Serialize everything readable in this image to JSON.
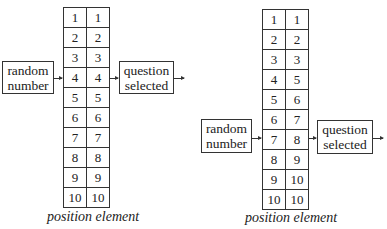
{
  "diagrams": [
    {
      "input_box": {
        "line1": "random",
        "line2": "number"
      },
      "output_box": {
        "line1": "question",
        "line2": "selected"
      },
      "caption": "position element",
      "input_row": 4,
      "table": {
        "columns": [
          "position",
          "element"
        ],
        "rows": [
          [
            "1",
            "1"
          ],
          [
            "2",
            "2"
          ],
          [
            "3",
            "3"
          ],
          [
            "4",
            "4"
          ],
          [
            "5",
            "5"
          ],
          [
            "6",
            "6"
          ],
          [
            "7",
            "7"
          ],
          [
            "8",
            "8"
          ],
          [
            "9",
            "9"
          ],
          [
            "10",
            "10"
          ]
        ]
      }
    },
    {
      "input_box": {
        "line1": "random",
        "line2": "number"
      },
      "output_box": {
        "line1": "question",
        "line2": "selected"
      },
      "caption": "position element",
      "input_row": 7,
      "table": {
        "columns": [
          "position",
          "element"
        ],
        "rows": [
          [
            "1",
            "1"
          ],
          [
            "2",
            "2"
          ],
          [
            "3",
            "3"
          ],
          [
            "4",
            "5"
          ],
          [
            "5",
            "6"
          ],
          [
            "6",
            "7"
          ],
          [
            "7",
            "8"
          ],
          [
            "8",
            "9"
          ],
          [
            "9",
            "10"
          ],
          [
            "10",
            "10"
          ]
        ]
      }
    }
  ]
}
